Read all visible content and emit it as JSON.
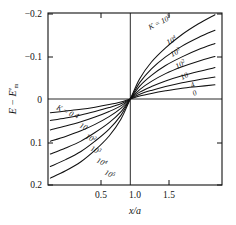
{
  "figure": {
    "background": "#ffffff",
    "line_color": "#111111",
    "frame": {
      "left": 48,
      "right": 222,
      "top": 13,
      "bottom": 185
    }
  },
  "axes": {
    "x": {
      "label": "x/a",
      "ticks": [
        {
          "value": 0.5,
          "label": "0.5",
          "px": 101
        },
        {
          "value": 1.0,
          "label": "1.0",
          "px": 135
        },
        {
          "value": 1.5,
          "label": "1.5",
          "px": 169
        }
      ],
      "range": [
        0.3,
        1.78
      ]
    },
    "y": {
      "label": "E − E'm",
      "label_parts": {
        "first": "E",
        "minus": "−",
        "second": "E",
        "prime": "′",
        "subscript": "m"
      },
      "inverted": true,
      "ticks": [
        {
          "value": -0.2,
          "label": "−0.2",
          "px": 14
        },
        {
          "value": -0.1,
          "label": "−0.1",
          "px": 57
        },
        {
          "value": 0.0,
          "label": "0",
          "px": 100
        },
        {
          "value": 0.1,
          "label": "0.1",
          "px": 143
        },
        {
          "value": 0.2,
          "label": "0.2",
          "px": 185
        }
      ],
      "range": [
        -0.2,
        0.2
      ]
    }
  },
  "reference_lines": [
    {
      "name": "zero-energy-line",
      "orientation": "horizontal",
      "value": 0.0
    },
    {
      "name": "unit-ratio-line",
      "orientation": "vertical",
      "value": 1.0
    }
  ],
  "curve_labels_upper": [
    {
      "text": "K = 10",
      "exponent": "5",
      "x": 150,
      "y": 30,
      "rotate": -27
    },
    {
      "text": "10",
      "exponent": "4",
      "x": 168,
      "y": 45,
      "rotate": -27
    },
    {
      "text": "10",
      "exponent": "3",
      "x": 172,
      "y": 57,
      "rotate": -27
    },
    {
      "text": "10",
      "exponent": "2",
      "x": 177,
      "y": 69,
      "rotate": -27
    },
    {
      "text": "10",
      "exponent": "",
      "x": 182,
      "y": 80,
      "rotate": -27
    },
    {
      "text": "4",
      "exponent": "",
      "x": 192,
      "y": 88,
      "rotate": -27
    },
    {
      "text": "0",
      "exponent": "",
      "x": 194,
      "y": 96,
      "rotate": -27
    }
  ],
  "curve_labels_lower": [
    {
      "text": "K = 0",
      "exponent": "",
      "x": 56,
      "y": 109,
      "rotate": 27
    },
    {
      "text": "4",
      "exponent": "",
      "x": 74,
      "y": 117,
      "rotate": 27
    },
    {
      "text": "10",
      "exponent": "",
      "x": 79,
      "y": 127,
      "rotate": 27
    },
    {
      "text": "10",
      "exponent": "2",
      "x": 85,
      "y": 138,
      "rotate": 27
    },
    {
      "text": "10",
      "exponent": "3",
      "x": 90,
      "y": 150,
      "rotate": 27
    },
    {
      "text": "10",
      "exponent": "4",
      "x": 96,
      "y": 162,
      "rotate": 27
    },
    {
      "text": "10",
      "exponent": "5",
      "x": 104,
      "y": 174,
      "rotate": 27
    }
  ],
  "chart_data": {
    "type": "line",
    "title": "",
    "xlabel": "x/a",
    "ylabel": "E − E'm",
    "xlim": [
      0.3,
      1.78
    ],
    "ylim": [
      -0.2,
      0.2
    ],
    "y_axis_inverted": true,
    "grid": false,
    "legend": "inline-curve-labels",
    "legend_parameter": "K",
    "annotations": [
      "K = 10⁵",
      "10⁴",
      "10³",
      "10²",
      "10",
      "4",
      "0"
    ],
    "symmetry": "point-symmetric about (1.0, 0)",
    "series": [
      {
        "name": "K = 0",
        "K": 0,
        "x": [
          0.32,
          0.45,
          0.58,
          0.7,
          0.82,
          0.92,
          1.0,
          1.08,
          1.18,
          1.3,
          1.44,
          1.58,
          1.72
        ],
        "y": [
          0.032,
          0.028,
          0.024,
          0.019,
          0.013,
          0.007,
          0.0,
          -0.007,
          -0.013,
          -0.019,
          -0.025,
          -0.029,
          -0.033
        ]
      },
      {
        "name": "K = 4",
        "K": 4,
        "x": [
          0.32,
          0.45,
          0.58,
          0.7,
          0.82,
          0.92,
          1.0,
          1.08,
          1.18,
          1.3,
          1.44,
          1.58,
          1.72
        ],
        "y": [
          0.05,
          0.044,
          0.037,
          0.029,
          0.02,
          0.011,
          0.0,
          -0.011,
          -0.02,
          -0.029,
          -0.038,
          -0.045,
          -0.051
        ]
      },
      {
        "name": "K = 10",
        "K": 10,
        "x": [
          0.32,
          0.45,
          0.58,
          0.7,
          0.82,
          0.92,
          1.0,
          1.08,
          1.18,
          1.3,
          1.44,
          1.58,
          1.72
        ],
        "y": [
          0.072,
          0.063,
          0.053,
          0.042,
          0.029,
          0.016,
          0.0,
          -0.016,
          -0.029,
          -0.042,
          -0.054,
          -0.064,
          -0.073
        ]
      },
      {
        "name": "K = 10^2",
        "K": 100,
        "x": [
          0.32,
          0.45,
          0.58,
          0.7,
          0.82,
          0.92,
          1.0,
          1.08,
          1.18,
          1.3,
          1.44,
          1.58,
          1.72
        ],
        "y": [
          0.098,
          0.087,
          0.074,
          0.059,
          0.041,
          0.022,
          0.0,
          -0.022,
          -0.041,
          -0.059,
          -0.075,
          -0.088,
          -0.099
        ]
      },
      {
        "name": "K = 10^3",
        "K": 1000,
        "x": [
          0.32,
          0.45,
          0.58,
          0.7,
          0.82,
          0.92,
          1.0,
          1.08,
          1.18,
          1.3,
          1.44,
          1.58,
          1.72
        ],
        "y": [
          0.128,
          0.114,
          0.098,
          0.078,
          0.055,
          0.03,
          0.0,
          -0.03,
          -0.055,
          -0.078,
          -0.098,
          -0.115,
          -0.129
        ]
      },
      {
        "name": "K = 10^4",
        "K": 10000,
        "x": [
          0.32,
          0.45,
          0.58,
          0.7,
          0.82,
          0.92,
          1.0,
          1.08,
          1.18,
          1.3,
          1.44,
          1.58,
          1.72
        ],
        "y": [
          0.157,
          0.141,
          0.122,
          0.098,
          0.07,
          0.038,
          0.0,
          -0.038,
          -0.07,
          -0.098,
          -0.123,
          -0.143,
          -0.16
        ]
      },
      {
        "name": "K = 10^5",
        "K": 100000,
        "x": [
          0.32,
          0.45,
          0.58,
          0.7,
          0.82,
          0.92,
          1.0,
          1.08,
          1.18,
          1.3,
          1.44,
          1.58,
          1.72
        ],
        "y": [
          0.184,
          0.167,
          0.146,
          0.119,
          0.086,
          0.047,
          0.0,
          -0.047,
          -0.086,
          -0.119,
          -0.15,
          -0.175,
          -0.196
        ]
      }
    ]
  }
}
